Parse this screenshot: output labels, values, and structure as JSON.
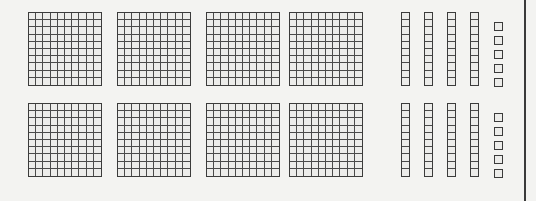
{
  "canvas": {
    "width": 536,
    "height": 201,
    "background": "#f3f3f1",
    "line_color": "#3b3b3b",
    "inner_line_color": "#4a4a4a",
    "cell_fill": "#ececea"
  },
  "edge_rule": {
    "name": "right-vertical-rule",
    "x": 524,
    "width": 2,
    "color": "#3a3a3a"
  },
  "legend": {
    "flat_label": "hundred-flat",
    "rod_label": "ten-rod",
    "unit_label": "unit-cube"
  },
  "geometry": {
    "flat_size": 74,
    "flat_xs": [
      28,
      117,
      206,
      289
    ],
    "rod_width": 9,
    "rod_height": 74,
    "rod_xs": [
      401,
      424,
      447,
      470
    ],
    "unit_size": 9,
    "unit_x": 494,
    "unit_ys_offsets": [
      10,
      24,
      38,
      52,
      66
    ]
  },
  "rows": [
    {
      "id": "row-top",
      "y_flat": 12,
      "y_rod": 12,
      "y_unit": 12,
      "flats": 4,
      "rods": 4,
      "units": 5,
      "value": 445
    },
    {
      "id": "row-bottom",
      "y_flat": 103,
      "y_rod": 103,
      "y_unit": 103,
      "flats": 4,
      "rods": 4,
      "units": 5,
      "value": 445
    }
  ],
  "flat_grid": {
    "cols": 10,
    "rows": 10
  },
  "rod_grid": {
    "cols": 1,
    "rows": 10
  }
}
